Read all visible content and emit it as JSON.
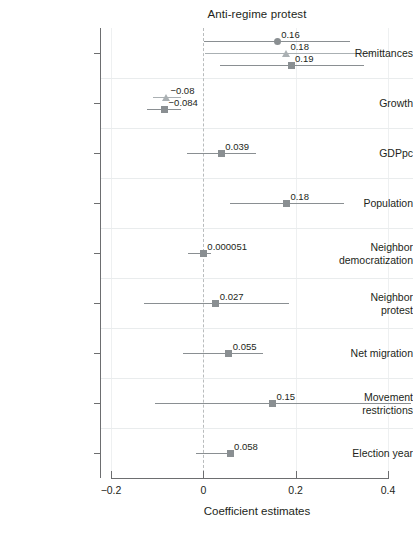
{
  "chart_data": {
    "type": "scatter",
    "title": "Anti-regime protest",
    "xlabel": "Coefficient estimates",
    "ylabel": "",
    "xlim": [
      -0.2,
      0.4
    ],
    "xticks": [
      -0.2,
      0,
      0.2,
      0.4
    ],
    "xtick_labels": [
      "−0.2",
      "0",
      "0.2",
      "0.4"
    ],
    "grid": true,
    "legend_position": "none",
    "reference_line": 0,
    "categories": [
      "Remittances",
      "Growth",
      "GDPpc",
      "Population",
      "Neighbor democratization",
      "Neighbor protest",
      "Net migration",
      "Movement restrictions",
      "Election year"
    ],
    "estimates": [
      {
        "category": "Remittances",
        "points": [
          {
            "marker": "circle",
            "label": "0.16",
            "value": 0.16,
            "ci_low": 0.002,
            "ci_high": 0.317,
            "color": "#8a8f92"
          },
          {
            "marker": "triangle",
            "label": "0.18",
            "value": 0.18,
            "ci_low": 0.004,
            "ci_high": 0.368,
            "color": "#aab0b3"
          },
          {
            "marker": "square",
            "label": "0.19",
            "value": 0.19,
            "ci_low": 0.037,
            "ci_high": 0.348,
            "color": "#8a8f92"
          }
        ]
      },
      {
        "category": "Growth",
        "points": [
          {
            "marker": "triangle",
            "label": "−0.08",
            "value": -0.08,
            "ci_low": -0.108,
            "ci_high": -0.048,
            "color": "#aab0b3"
          },
          {
            "marker": "square",
            "label": "−0.084",
            "value": -0.084,
            "ci_low": -0.122,
            "ci_high": -0.048,
            "color": "#8a8f92"
          }
        ]
      },
      {
        "category": "GDPpc",
        "points": [
          {
            "marker": "square",
            "label": "0.039",
            "value": 0.039,
            "ci_low": -0.035,
            "ci_high": 0.115,
            "color": "#8a8f92"
          }
        ]
      },
      {
        "category": "Population",
        "points": [
          {
            "marker": "square",
            "label": "0.18",
            "value": 0.18,
            "ci_low": 0.058,
            "ci_high": 0.305,
            "color": "#8a8f92"
          }
        ]
      },
      {
        "category": "Neighbor democratization",
        "points": [
          {
            "marker": "square",
            "label": "0.000051",
            "value": 5.1e-05,
            "ci_low": -0.033,
            "ci_high": 0.016,
            "color": "#8a8f92"
          }
        ]
      },
      {
        "category": "Neighbor protest",
        "points": [
          {
            "marker": "square",
            "label": "0.027",
            "value": 0.027,
            "ci_low": -0.128,
            "ci_high": 0.185,
            "color": "#8a8f92"
          }
        ]
      },
      {
        "category": "Net migration",
        "points": [
          {
            "marker": "square",
            "label": "0.055",
            "value": 0.055,
            "ci_low": -0.045,
            "ci_high": 0.13,
            "color": "#8a8f92"
          }
        ]
      },
      {
        "category": "Movement restrictions",
        "points": [
          {
            "marker": "square",
            "label": "0.15",
            "value": 0.15,
            "ci_low": -0.105,
            "ci_high": 0.45,
            "color": "#8a8f92"
          }
        ]
      },
      {
        "category": "Election year",
        "points": [
          {
            "marker": "square",
            "label": "0.058",
            "value": 0.058,
            "ci_low": -0.015,
            "ci_high": 0.062,
            "color": "#8a8f92"
          }
        ]
      }
    ]
  },
  "style": {
    "axis_color": "#6d6e70",
    "grid_color": "#e9eced",
    "zero_line_color": "#b9bcbd",
    "text_color": "#231f20"
  }
}
